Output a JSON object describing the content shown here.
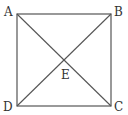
{
  "diagram": {
    "type": "square-with-diagonals",
    "vertices": {
      "A": {
        "label": "A",
        "x": 17,
        "y": 14
      },
      "B": {
        "label": "B",
        "x": 111,
        "y": 14
      },
      "C": {
        "label": "C",
        "x": 111,
        "y": 106
      },
      "D": {
        "label": "D",
        "x": 17,
        "y": 106
      }
    },
    "intersection": {
      "label": "E"
    },
    "line_color": "#555555"
  }
}
